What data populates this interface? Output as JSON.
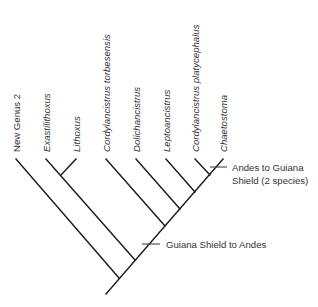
{
  "diagram": {
    "type": "cladogram",
    "taxa": [
      {
        "id": "new-genus-2",
        "label": "New Genus 2",
        "italic": false
      },
      {
        "id": "exastilithoxus",
        "label": "Exastilithoxus",
        "italic": true
      },
      {
        "id": "lithoxus",
        "label": "Lithoxus",
        "italic": true
      },
      {
        "id": "cordylancistrus-torbesensis",
        "label": "Cordylancistrus torbesensis",
        "italic": true
      },
      {
        "id": "dolichancistrus",
        "label": "Dolichancistrus",
        "italic": true
      },
      {
        "id": "leptoancistrus",
        "label": "Leptoancistrus",
        "italic": true
      },
      {
        "id": "cordylancistrus-platycephalus",
        "label": "Cordylancistrus platycephalus",
        "italic": true
      },
      {
        "id": "chaetostoma",
        "label": "Chaetostoma",
        "italic": true
      }
    ],
    "annotations": [
      {
        "id": "guiana-to-andes",
        "lines": [
          "Guiana Shield to Andes"
        ]
      },
      {
        "id": "andes-to-guiana",
        "lines": [
          "Andes to Guiana",
          "Shield (2 species)"
        ]
      }
    ],
    "topology": "(New Genus 2,((Exastilithoxus,Lithoxus),(Cordylancistrus torbesensis,(Dolichancistrus,(Leptoancistrus,(Cordylancistrus platycephalus,Chaetostoma))))))"
  }
}
